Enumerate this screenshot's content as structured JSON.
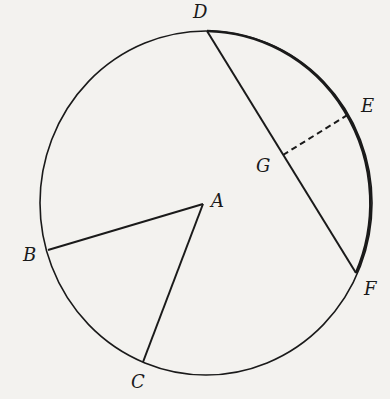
{
  "diagram": {
    "type": "circle-geometry",
    "circle": {
      "cx": 206,
      "cy": 203,
      "rx": 166,
      "ry": 172
    },
    "points": {
      "A": {
        "x": 203,
        "y": 204,
        "label": "A"
      },
      "B": {
        "x": 48,
        "y": 250,
        "label": "B"
      },
      "C": {
        "x": 143,
        "y": 362,
        "label": "C"
      },
      "D": {
        "x": 207,
        "y": 31,
        "label": "D"
      },
      "E": {
        "x": 349,
        "y": 114,
        "label": "E"
      },
      "F": {
        "x": 356,
        "y": 273,
        "label": "F"
      },
      "G": {
        "x": 283,
        "y": 155,
        "label": "G"
      }
    },
    "segments": [
      {
        "from": "A",
        "to": "B",
        "style": "solid"
      },
      {
        "from": "A",
        "to": "C",
        "style": "solid"
      },
      {
        "from": "D",
        "to": "F",
        "style": "solid"
      },
      {
        "from": "G",
        "to": "E",
        "style": "dashed"
      }
    ],
    "colors": {
      "background": "#f3f2ef",
      "ink": "#1a1a1a"
    }
  }
}
